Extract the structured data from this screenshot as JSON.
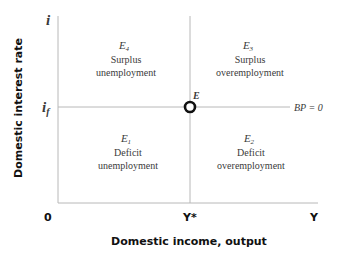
{
  "diagram": {
    "y_axis_label": "Domestic interest rate",
    "x_axis_label": "Domestic income, output",
    "y_axis_symbol": "i",
    "y_level_symbol": "i",
    "y_level_subscript": "f",
    "origin_label": "0",
    "x_level_label": "Y*",
    "x_axis_symbol": "Y",
    "equilibrium_label": "E",
    "line_label": "BP = 0",
    "quadrants": [
      {
        "id": "E4",
        "symbol": "E",
        "sub": "4",
        "line1": "Surplus",
        "line2": "unemployment"
      },
      {
        "id": "E3",
        "symbol": "E",
        "sub": "3",
        "line1": "Surplus",
        "line2": "overemployment"
      },
      {
        "id": "E1",
        "symbol": "E",
        "sub": "1",
        "line1": "Deficit",
        "line2": "unemployment"
      },
      {
        "id": "E2",
        "symbol": "E",
        "sub": "2",
        "line1": "Deficit",
        "line2": "overemployment"
      }
    ]
  }
}
